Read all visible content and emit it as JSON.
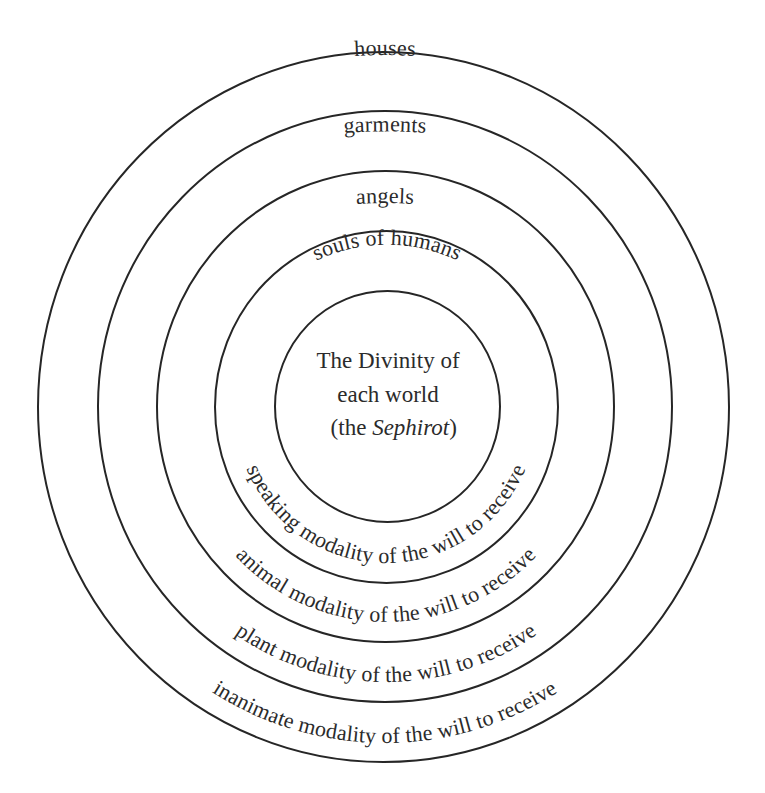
{
  "diagram": {
    "type": "concentric-rings",
    "center": {
      "lines": [
        "The Divinity of",
        "each world"
      ],
      "line3_prefix": "(the ",
      "line3_italic": "Sephirot",
      "line3_suffix": ")"
    },
    "rings": [
      {
        "index": 1,
        "position": "outermost",
        "top_label": "houses",
        "bottom_label": "inanimate modality of the will to receive"
      },
      {
        "index": 2,
        "top_label": "garments",
        "bottom_label": "plant modality of the will to receive"
      },
      {
        "index": 3,
        "top_label": "angels",
        "bottom_label": "animal modality of the will to receive"
      },
      {
        "index": 4,
        "top_label": "souls of humans",
        "bottom_label": "speaking modality of the will to receive"
      },
      {
        "index": 5,
        "position": "innermost",
        "top_label": "",
        "bottom_label": ""
      }
    ],
    "colors": {
      "line": "#262626",
      "text": "#2b2b2b",
      "background": "#ffffff"
    }
  }
}
